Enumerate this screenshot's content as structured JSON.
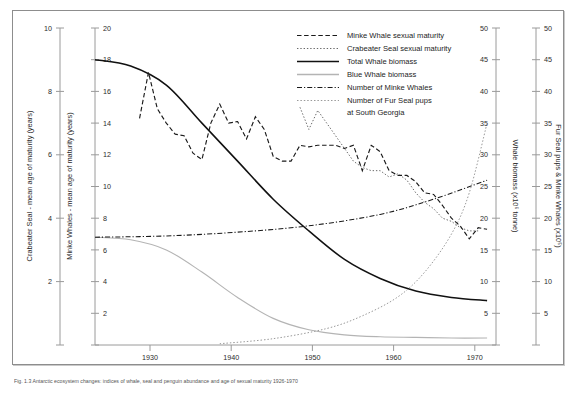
{
  "figure": {
    "caption": "Fig. 1.3 Antarctic ecosystem changes: indices of whale, seal and penguin abundance and age of sexual maturity 1926-1970"
  },
  "axes": {
    "left_outer": {
      "title": "Crabeater Seal - mean age of maturity (years)",
      "ticks": [
        "10",
        "8",
        "6",
        "4",
        "2"
      ],
      "min": 0,
      "max": 10,
      "step": 2
    },
    "left_inner": {
      "title": "Minke Whales - mean age of maturity (years)",
      "ticks": [
        "20",
        "18",
        "16",
        "14",
        "12",
        "10",
        "8",
        "6",
        "4",
        "2"
      ],
      "min": 0,
      "max": 20,
      "step": 2
    },
    "right_inner": {
      "title": "Whale biomass (x10⁶ tonne)",
      "ticks": [
        "50",
        "45",
        "40",
        "35",
        "30",
        "25",
        "20",
        "15",
        "10",
        "5"
      ],
      "min": 0,
      "max": 50,
      "step": 5
    },
    "right_outer": {
      "title": "Fur Seal pups & Minke Whales (x10⁵)",
      "ticks": [
        "50",
        "45",
        "40",
        "35",
        "30",
        "25",
        "20",
        "15",
        "10",
        "5"
      ],
      "min": 0,
      "max": 50,
      "step": 5
    },
    "bottom": {
      "title": "",
      "ticks": [
        "1930",
        "1940",
        "1950",
        "1960",
        "1970"
      ],
      "min": 1926,
      "max": 1971
    }
  },
  "legend": {
    "items": [
      {
        "label": "Minke Whale sexual maturity",
        "style": "dashed",
        "color": "#1a1a1a"
      },
      {
        "label": "Crabeater Seal sexual maturity",
        "style": "dotted",
        "color": "#6a6a6a"
      },
      {
        "label": "Total Whale biomass",
        "style": "solid",
        "color": "#111111"
      },
      {
        "label": "Blue Whale biomass",
        "style": "solid-gray",
        "color": "#b4b4b4"
      },
      {
        "label": "Number of Minke Whales",
        "style": "dash-dot",
        "color": "#1a1a1a"
      },
      {
        "label": "Number of Fur Seal pups",
        "style": "dotted",
        "color": "#9a9a9a"
      }
    ],
    "continuation_line": "at South Georgia"
  },
  "chart_data": {
    "type": "line",
    "title": "",
    "xlabel": "",
    "ylabel": "",
    "xlim": [
      1926,
      1971
    ],
    "grid": false,
    "legend_position": "top-center",
    "series": [
      {
        "name": "Minke Whale sexual maturity",
        "axis": "left_inner",
        "units": "years",
        "style": "dashed",
        "x": [
          1931,
          1932,
          1933,
          1934,
          1935,
          1936,
          1937,
          1938,
          1939,
          1940,
          1941,
          1942,
          1943,
          1944,
          1945,
          1946,
          1947,
          1948,
          1949,
          1950,
          1951,
          1952,
          1953,
          1954,
          1955,
          1956,
          1957,
          1958,
          1959,
          1960,
          1961,
          1962,
          1963,
          1964,
          1965,
          1966,
          1967,
          1968,
          1969,
          1970
        ],
        "y": [
          14.3,
          17.2,
          14.9,
          14.0,
          13.3,
          13.2,
          12.1,
          11.7,
          14.0,
          15.2,
          14.0,
          14.1,
          13.0,
          14.4,
          13.6,
          11.9,
          11.6,
          11.6,
          12.6,
          12.5,
          12.6,
          12.6,
          12.6,
          12.4,
          12.6,
          11.0,
          12.6,
          12.2,
          11.0,
          10.7,
          10.7,
          10.3,
          9.6,
          9.5,
          8.8,
          8.0,
          7.5,
          6.7,
          7.4,
          7.3
        ]
      },
      {
        "name": "Crabeater Seal sexual maturity",
        "axis": "left_outer",
        "units": "years",
        "style": "dotted",
        "x": [
          1949,
          1950,
          1951,
          1952,
          1953,
          1954,
          1955,
          1956,
          1957,
          1958,
          1959,
          1960,
          1961,
          1962,
          1963,
          1964,
          1965,
          1966,
          1967,
          1968,
          1969
        ],
        "y": [
          7.5,
          6.8,
          7.4,
          7.0,
          6.6,
          6.2,
          5.8,
          5.6,
          5.5,
          5.5,
          5.3,
          5.4,
          5.2,
          4.8,
          4.5,
          4.3,
          4.0,
          3.9,
          3.7,
          3.6,
          3.6
        ]
      },
      {
        "name": "Total Whale biomass",
        "axis": "right_inner",
        "units": "x10^6 tonne",
        "style": "solid",
        "x": [
          1926,
          1930,
          1934,
          1938,
          1942,
          1946,
          1950,
          1954,
          1958,
          1962,
          1966,
          1970
        ],
        "y": [
          45.0,
          44.0,
          41.0,
          35.0,
          29.0,
          23.0,
          18.0,
          13.5,
          10.5,
          8.5,
          7.5,
          7.0
        ]
      },
      {
        "name": "Blue Whale biomass",
        "axis": "right_inner",
        "units": "x10^6 tonne",
        "style": "solid-gray",
        "x": [
          1926,
          1930,
          1934,
          1938,
          1942,
          1946,
          1950,
          1954,
          1958,
          1962,
          1966,
          1970
        ],
        "y": [
          17.0,
          16.6,
          15.0,
          11.5,
          7.5,
          4.2,
          2.4,
          1.6,
          1.3,
          1.2,
          1.1,
          1.1
        ]
      },
      {
        "name": "Number of Minke Whales",
        "axis": "right_outer",
        "units": "x10^5",
        "style": "dash-dot",
        "x": [
          1926,
          1934,
          1942,
          1950,
          1958,
          1964,
          1970
        ],
        "y": [
          17.0,
          17.2,
          17.8,
          18.8,
          20.6,
          23.0,
          26.0
        ]
      },
      {
        "name": "Number of Fur Seal pups at South Georgia",
        "axis": "right_outer",
        "units": "x10^5",
        "style": "dotted",
        "x": [
          1940,
          1946,
          1952,
          1956,
          1960,
          1963,
          1966,
          1968,
          1970
        ],
        "y": [
          0.2,
          1.0,
          2.6,
          4.6,
          7.6,
          11.5,
          17.5,
          24.0,
          35.0
        ]
      }
    ]
  }
}
